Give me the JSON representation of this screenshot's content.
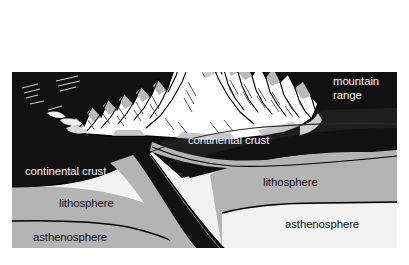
{
  "diagram": {
    "kind": "geologic-cross-section",
    "background_color": "#ffffff",
    "frame": {
      "left": 12,
      "top": 72,
      "right": 397,
      "bottom": 248
    },
    "colors": {
      "crust": "#111111",
      "crust_shadow": "#1e1e1e",
      "lithosphere": "#b4b4b4",
      "lithosphere_shadow": "#a3a3a3",
      "asthenosphere": "#f2f2f2",
      "outline": "#000000",
      "mountain_snow": "#ffffff",
      "mountain_shade": "#b9b9b9",
      "mountain_shade_dark": "#8d8d8d",
      "label_light": "#f4f4f4",
      "label_dark": "#111111"
    },
    "labels": [
      {
        "id": "mountain-range",
        "text_line_1": "mountain",
        "text_line_2": "range",
        "full_text": "mountain range",
        "color": "#f4f4f4",
        "x": 333,
        "y": 85
      },
      {
        "id": "continental-crust-right",
        "full_text": "continental crust",
        "color": "#f4f4f4",
        "x": 188,
        "y": 144
      },
      {
        "id": "continental-crust-left",
        "full_text": "continental crust",
        "color": "#f4f4f4",
        "x": 25,
        "y": 175
      },
      {
        "id": "lithosphere-right",
        "full_text": "lithosphere",
        "color": "#111111",
        "x": 263,
        "y": 186
      },
      {
        "id": "lithosphere-left",
        "full_text": "lithosphere",
        "color": "#111111",
        "x": 59,
        "y": 207
      },
      {
        "id": "asthenosphere-right",
        "full_text": "asthenosphere",
        "color": "#111111",
        "x": 285,
        "y": 228
      },
      {
        "id": "asthenosphere-left",
        "full_text": "asthenosphere",
        "color": "#111111",
        "x": 33,
        "y": 241
      }
    ]
  }
}
